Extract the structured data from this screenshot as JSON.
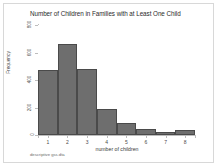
{
  "figure": {
    "background_color": "#ffffff",
    "frame_color": "#d8d8d8",
    "caption": "descriptive gss.dta"
  },
  "chart_data": {
    "type": "bar",
    "title": "Number of Children in Families with at Least One Child",
    "xlabel": "number of children",
    "ylabel": "Frequency",
    "categories": [
      "1",
      "2",
      "3",
      "4",
      "5",
      "6",
      "7",
      "8"
    ],
    "values": [
      470,
      660,
      480,
      190,
      85,
      45,
      20,
      40
    ],
    "x": [
      1,
      2,
      3,
      4,
      5,
      6,
      7,
      8
    ],
    "xlim": [
      0.5,
      8.5
    ],
    "ylim": [
      0,
      800
    ],
    "xticks": [
      "1",
      "2",
      "3",
      "4",
      "5",
      "6",
      "7",
      "8"
    ],
    "yticks": [
      "0",
      "200",
      "400",
      "600",
      "800"
    ],
    "ytick_values": [
      0,
      200,
      400,
      600,
      800
    ],
    "grid": false,
    "legend": false,
    "bar_color": "#6e6e6e",
    "bar_edge_color": "#4a4a4a",
    "bar_width": 1
  }
}
